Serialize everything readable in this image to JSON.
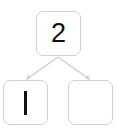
{
  "diagram": {
    "type": "number-bond",
    "whole": {
      "value": "2"
    },
    "parts": [
      {
        "value": "1"
      },
      {
        "value": ""
      }
    ],
    "colors": {
      "box_border": "#cfcfcf",
      "connector": "#cccccc",
      "text": "#111111"
    }
  }
}
